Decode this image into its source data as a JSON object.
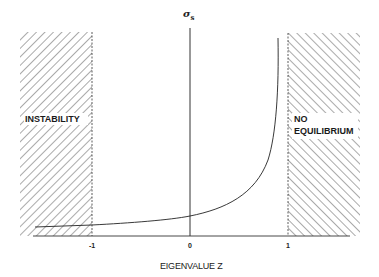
{
  "diagram": {
    "y_axis_label": "σ",
    "y_axis_label_sub": "s",
    "x_axis_label": "EIGENVALUE Z",
    "ticks": [
      "-1",
      "0",
      "1"
    ],
    "regions": {
      "left": {
        "label": "INSTABILITY"
      },
      "right": {
        "label_line1": "NO",
        "label_line2": "EQUILIBRIUM"
      }
    },
    "colors": {
      "line": "#222222",
      "hatch": "#555555",
      "background": "#ffffff"
    }
  }
}
